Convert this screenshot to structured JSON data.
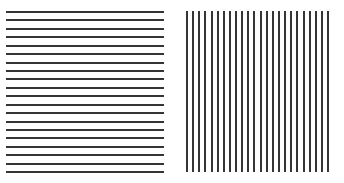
{
  "figure": {
    "canvas_width": 344,
    "canvas_height": 183,
    "background_color": "#ffffff",
    "stripe_color": "#353535"
  },
  "panels": [
    {
      "id": "horizontal-stripes",
      "label": "Horizontal stripe grating",
      "orientation": "horizontal",
      "line_count": 20,
      "line_thickness_px": 2,
      "spacing_px": 8.4,
      "origin_x": 6,
      "origin_y": 11,
      "width": 158,
      "height": 161,
      "color": "#353535"
    },
    {
      "id": "vertical-stripes",
      "label": "Vertical stripe grating",
      "orientation": "vertical",
      "line_count": 24,
      "line_thickness_px": 2,
      "spacing_px": 6.13,
      "origin_x": 186,
      "origin_y": 11,
      "width": 143,
      "height": 161,
      "color": "#353535"
    }
  ],
  "chart_data": {
    "type": "other",
    "title": "",
    "subtitle": "",
    "xlabel": "",
    "ylabel": "",
    "legend": [],
    "annotations": [],
    "series": [
      {
        "name": "Horizontal stripe grating",
        "orientation": "horizontal",
        "count": 20,
        "stripe_thickness_px": 2,
        "stripe_spacing_px": 8.4,
        "positions_px": [
          0,
          8.4,
          16.8,
          25.3,
          33.7,
          42.1,
          50.5,
          58.9,
          67.4,
          75.8,
          84.2,
          92.6,
          101.1,
          109.5,
          117.9,
          126.3,
          134.7,
          143.2,
          151.6,
          160.0
        ]
      },
      {
        "name": "Vertical stripe grating",
        "orientation": "vertical",
        "count": 24,
        "stripe_thickness_px": 2,
        "stripe_spacing_px": 6.13,
        "positions_px": [
          0,
          6.1,
          12.3,
          18.4,
          24.5,
          30.7,
          36.8,
          42.9,
          49.0,
          55.2,
          61.3,
          67.4,
          73.6,
          79.7,
          85.8,
          92.0,
          98.1,
          104.2,
          110.3,
          116.5,
          122.6,
          128.7,
          134.9,
          141.0
        ]
      }
    ]
  }
}
